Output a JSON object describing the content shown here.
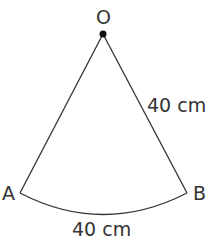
{
  "diagram": {
    "type": "sector",
    "points": {
      "center": {
        "label": "O",
        "x": 103,
        "y": 34
      },
      "a": {
        "label": "A",
        "x": 20,
        "y": 193
      },
      "b": {
        "label": "B",
        "x": 187,
        "y": 193
      }
    },
    "radius_label": "40 cm",
    "arc_label": "40 cm",
    "line_color": "#333333",
    "dot_color": "#111111"
  }
}
